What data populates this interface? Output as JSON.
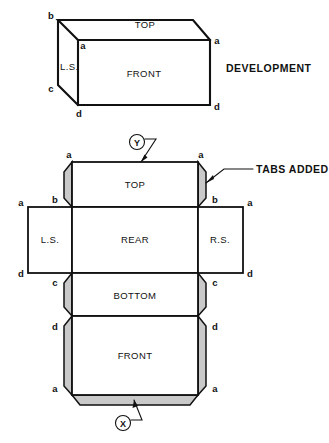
{
  "figure": {
    "title_text": "DEVELOPMENT",
    "tabs_callout": "TABS ADDED",
    "markers": {
      "top": "Y",
      "bottom": "X"
    }
  },
  "isometric_box": {
    "faces": {
      "top": "TOP",
      "front": "FRONT",
      "left_side": "L.S."
    },
    "vertices": {
      "rear_top_left": "b",
      "front_top_left": "a",
      "front_top_right": "a",
      "rear_bottom_left": "c",
      "front_bottom_left": "d",
      "front_bottom_right": "d"
    }
  },
  "development": {
    "panels": {
      "top": "TOP",
      "left_side": "L.S.",
      "rear": "REAR",
      "right_side": "R.S.",
      "bottom": "BOTTOM",
      "front": "FRONT"
    },
    "vertices": {
      "top_left_a": "a",
      "top_right_a": "a",
      "top_tab_left_b": "b",
      "top_tab_right_b": "b",
      "mid_left_a": "a",
      "mid_right_a": "a",
      "mid_left_d": "d",
      "mid_right_d": "d",
      "bottom_tab_left_c": "c",
      "bottom_tab_right_c": "c",
      "front_tab_left_d": "d",
      "front_tab_right_d": "d",
      "front_tab_left_a": "a",
      "front_tab_right_a": "a"
    }
  },
  "colors": {
    "line": "#111111",
    "tab_fill": "#c9c9c9",
    "face_fill": "#ffffff",
    "background": "#ffffff"
  }
}
